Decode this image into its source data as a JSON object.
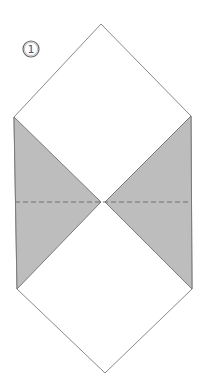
{
  "diagram": {
    "type": "origami-step",
    "step": {
      "number": "1",
      "label": "①"
    },
    "colors": {
      "background": "#ffffff",
      "paper_white": "#ffffff",
      "paper_shaded": "#bdbdbd",
      "outline": "#8a8a8a",
      "fold_line": "#6f6f6f"
    },
    "shape": {
      "outline_points": [
        [
          101,
          24
        ],
        [
          191,
          116
        ],
        [
          192,
          289
        ],
        [
          105,
          373
        ],
        [
          17,
          289
        ],
        [
          14,
          117
        ]
      ],
      "left_shaded_triangle": [
        [
          14,
          117
        ],
        [
          101,
          202
        ],
        [
          17,
          289
        ]
      ],
      "right_shaded_triangle": [
        [
          191,
          116
        ],
        [
          105,
          202
        ],
        [
          192,
          289
        ]
      ],
      "valley_fold_line": {
        "x1": 15,
        "y1": 202,
        "x2": 191,
        "y2": 202,
        "style": "dashed"
      }
    }
  }
}
